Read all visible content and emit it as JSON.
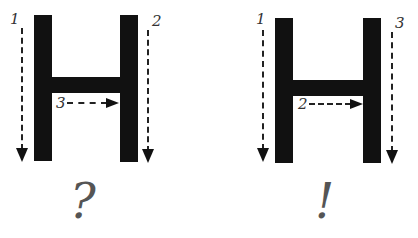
{
  "panels": [
    {
      "id": "left",
      "letter": "H",
      "strokes": [
        {
          "order": "1",
          "direction": "down",
          "target": "left-vertical"
        },
        {
          "order": "2",
          "direction": "down",
          "target": "right-vertical"
        },
        {
          "order": "3",
          "direction": "right",
          "target": "crossbar"
        }
      ],
      "verdict": "?"
    },
    {
      "id": "right",
      "letter": "H",
      "strokes": [
        {
          "order": "1",
          "direction": "down",
          "target": "left-vertical"
        },
        {
          "order": "2",
          "direction": "right",
          "target": "crossbar"
        },
        {
          "order": "3",
          "direction": "down",
          "target": "right-vertical"
        }
      ],
      "verdict": "!"
    }
  ],
  "colors": {
    "ink": "#111111",
    "arrow": "#222222",
    "label": "#333333",
    "mark": "#555555",
    "background": "#ffffff"
  }
}
